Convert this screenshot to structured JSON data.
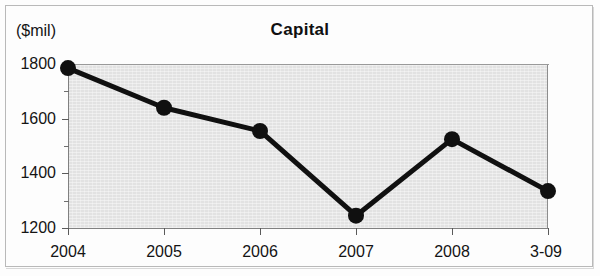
{
  "figure": {
    "title": "Capital",
    "units_label": "($mil)"
  },
  "chart_data": {
    "type": "line",
    "title": "Capital",
    "subtitle": "",
    "xlabel": "",
    "ylabel": "($mil)",
    "categories": [
      "2004",
      "2005",
      "2006",
      "2007",
      "2008",
      "3-09"
    ],
    "values": [
      1785,
      1640,
      1555,
      1245,
      1525,
      1335
    ],
    "series": [
      {
        "name": "Capital",
        "values": [
          1785,
          1640,
          1555,
          1245,
          1525,
          1335
        ]
      }
    ],
    "ylim": [
      1200,
      1800
    ],
    "xlim": [
      0,
      5
    ],
    "y_ticks": [
      1200,
      1400,
      1600,
      1800
    ],
    "y_tick_labels": [
      "1200",
      "1400",
      "1600",
      "1800"
    ],
    "y_minor_ticks": [
      1300,
      1500,
      1700
    ],
    "x_tick_labels": [
      "2004",
      "2005",
      "2006",
      "2007",
      "2008",
      "3-09"
    ],
    "grid": false,
    "legend": null,
    "legend_position": "none",
    "marker": "filled-circle",
    "line_color": "#101010",
    "marker_color": "#101010",
    "plot_background": "#e2e2e2",
    "annotations": []
  },
  "axes": {
    "y_ticks": [
      {
        "label": "1800",
        "value": 1800
      },
      {
        "label": "1600",
        "value": 1600
      },
      {
        "label": "1400",
        "value": 1400
      },
      {
        "label": "1200",
        "value": 1200
      }
    ],
    "x_ticks": [
      {
        "label": "2004",
        "value": 0
      },
      {
        "label": "2005",
        "value": 1
      },
      {
        "label": "2006",
        "value": 2
      },
      {
        "label": "2007",
        "value": 3
      },
      {
        "label": "2008",
        "value": 4
      },
      {
        "label": "3-09",
        "value": 5
      }
    ]
  }
}
